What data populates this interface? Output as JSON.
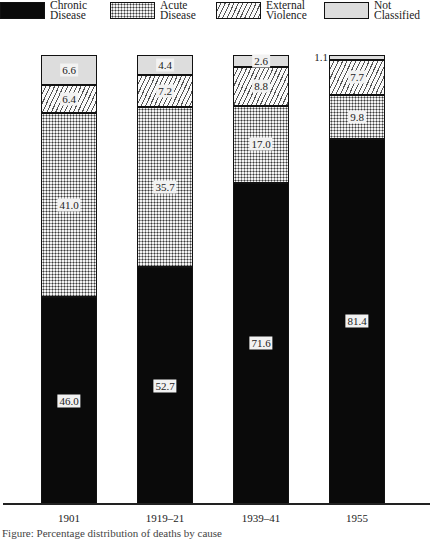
{
  "legend": [
    {
      "key": "chronic",
      "label": "Chronic\nDisease",
      "pattern": "solid-black",
      "x": 0
    },
    {
      "key": "acute",
      "label": "Acute\nDisease",
      "pattern": "dotted",
      "x": 110
    },
    {
      "key": "violence",
      "label": "External\nViolence",
      "pattern": "diagonal-hatch",
      "x": 216
    },
    {
      "key": "notclass",
      "label": "Not\nClassified",
      "pattern": "light-stipple",
      "x": 324
    }
  ],
  "chart_data": {
    "type": "bar",
    "stacked": true,
    "title": "",
    "xlabel": "",
    "ylabel": "",
    "ylim": [
      0,
      100
    ],
    "grid": false,
    "legend_position": "top",
    "categories": [
      "1901",
      "1919–21",
      "1939–41",
      "1955"
    ],
    "series": [
      {
        "name": "Chronic Disease",
        "key": "chronic",
        "values": [
          46.0,
          52.7,
          71.6,
          81.4
        ]
      },
      {
        "name": "Acute Disease",
        "key": "acute",
        "values": [
          41.0,
          35.7,
          17.0,
          9.8
        ]
      },
      {
        "name": "External Violence",
        "key": "violence",
        "values": [
          6.4,
          7.2,
          8.8,
          7.7
        ]
      },
      {
        "name": "Not Classified",
        "key": "notclass",
        "values": [
          6.6,
          4.4,
          2.6,
          1.1
        ]
      }
    ],
    "value_labels": [
      [
        "46.0",
        "41.0",
        "6.4",
        "6.6"
      ],
      [
        "52.7",
        "35.7",
        "7.2",
        "4.4"
      ],
      [
        "71.6",
        "17.0",
        "8.8",
        "2.6"
      ],
      [
        "81.4",
        "9.8",
        "7.7",
        "1.1"
      ]
    ]
  },
  "layout": {
    "bar_left": [
      41,
      137,
      233,
      329
    ],
    "bar_width": 56,
    "baseline_y": 504,
    "px_per_percent": 4.49
  },
  "caption_partial": "Figure: Percentage distribution of deaths by cause"
}
